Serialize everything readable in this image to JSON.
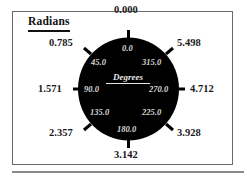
{
  "diagram": {
    "title": "Radians",
    "center_label": "Degrees",
    "colors": {
      "dial_fill": "#000000",
      "radian_text": "#1a1a1a",
      "degree_text": "#d8d8d8",
      "frame_border": "#6a6a6a"
    },
    "positions": [
      {
        "direction": "top",
        "radians": "0.000",
        "degrees": "0.0"
      },
      {
        "direction": "top-left",
        "radians": "0.785",
        "degrees": "45.0"
      },
      {
        "direction": "left",
        "radians": "1.571",
        "degrees": "90.0"
      },
      {
        "direction": "bottom-left",
        "radians": "2.357",
        "degrees": "135.0"
      },
      {
        "direction": "bottom",
        "radians": "3.142",
        "degrees": "180.0"
      },
      {
        "direction": "bottom-right",
        "radians": "3.928",
        "degrees": "225.0"
      },
      {
        "direction": "right",
        "radians": "4.712",
        "degrees": "270.0"
      },
      {
        "direction": "top-right",
        "radians": "5.498",
        "degrees": "315.0"
      }
    ]
  }
}
